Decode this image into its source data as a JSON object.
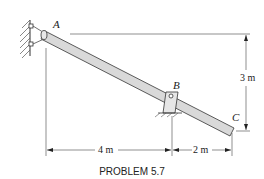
{
  "figure": {
    "caption": "PROBLEM 5.7",
    "points": {
      "A": "A",
      "B": "B",
      "C": "C"
    },
    "dimensions": {
      "horizontal_AB": "4 m",
      "horizontal_BC": "2 m",
      "vertical_AC": "3 m"
    },
    "colors": {
      "bar_fill": "#d9d9d9",
      "bar_stroke": "#333333",
      "line": "#333333",
      "background": "#ffffff"
    }
  }
}
